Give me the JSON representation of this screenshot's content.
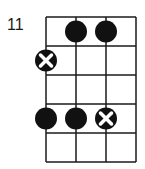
{
  "chord_diagram": {
    "start_fret_label": "11",
    "strings": 4,
    "frets": 5,
    "grid": {
      "left": 46,
      "top": 17,
      "string_spacing": 30,
      "fret_spacing": 29
    },
    "colors": {
      "line": "#1a1a1a",
      "dot": "#111111",
      "background": "#ffffff"
    },
    "markers": [
      {
        "type": "dot",
        "string": 2,
        "fret": 1
      },
      {
        "type": "dot",
        "string": 3,
        "fret": 1
      },
      {
        "type": "x-dot",
        "string": 1,
        "fret": 2
      },
      {
        "type": "dot",
        "string": 1,
        "fret": 4
      },
      {
        "type": "dot",
        "string": 2,
        "fret": 4
      },
      {
        "type": "x-dot",
        "string": 3,
        "fret": 4
      }
    ]
  }
}
